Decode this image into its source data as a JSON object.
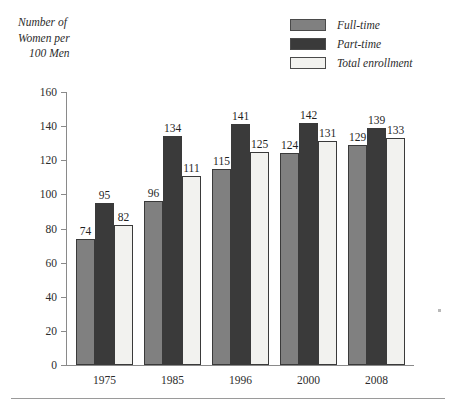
{
  "axis_title": {
    "line1": "Number of",
    "line2": "Women per",
    "line3": "100 Men"
  },
  "legend": {
    "items": [
      {
        "label": "Full-time",
        "color": "#808080"
      },
      {
        "label": "Part-time",
        "color": "#3a3a3a"
      },
      {
        "label": "Total enrollment",
        "color": "#f2f2ef"
      }
    ]
  },
  "chart_data": {
    "type": "bar",
    "title": "",
    "subtitle": "",
    "xlabel": "",
    "ylabel": "Number of Women per 100 Men",
    "ylim": [
      0,
      160
    ],
    "yticks": [
      0,
      20,
      40,
      60,
      80,
      100,
      120,
      140,
      160
    ],
    "ytick_labels": [
      "0",
      "20",
      "40",
      "60",
      "80",
      "100",
      "120",
      "140",
      "160"
    ],
    "grid": false,
    "legend_position": "top-right",
    "categories": [
      "1975",
      "1985",
      "1996",
      "2000",
      "2008"
    ],
    "series": [
      {
        "name": "Full-time",
        "color": "#808080",
        "values": [
          74,
          96,
          115,
          124,
          129
        ]
      },
      {
        "name": "Part-time",
        "color": "#3a3a3a",
        "values": [
          95,
          134,
          141,
          142,
          139
        ]
      },
      {
        "name": "Total enrollment",
        "color": "#f2f2ef",
        "values": [
          82,
          111,
          125,
          131,
          133
        ]
      }
    ]
  }
}
